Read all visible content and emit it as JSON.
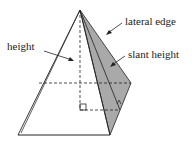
{
  "diagram": {
    "labels": {
      "height": "height",
      "lateral_edge": "lateral edge",
      "slant_height": "slant height"
    },
    "colors": {
      "stroke": "#222222",
      "shaded_face": "#a9a9a9",
      "background": "#ffffff"
    }
  }
}
